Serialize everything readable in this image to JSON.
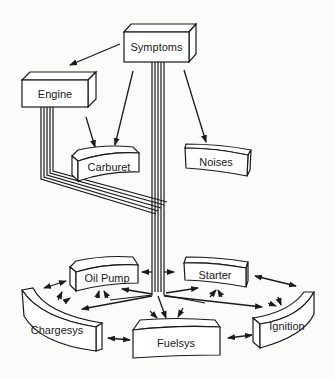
{
  "diagram": {
    "nodes": {
      "symptoms": "Symptoms",
      "engine": "Engine",
      "carburet": "Carburet",
      "noises": "Noises",
      "oil_pump": "Oil Pump",
      "starter": "Starter",
      "chargesys": "Chargesys",
      "fuelsys": "Fuelsys",
      "ignition": "Ignition"
    },
    "edges": [
      {
        "from": "Symptoms",
        "to": "Engine",
        "type": "arrow"
      },
      {
        "from": "Symptoms",
        "to": "Carburet",
        "type": "arrow"
      },
      {
        "from": "Symptoms",
        "to": "Noises",
        "type": "arrow"
      },
      {
        "from": "Engine",
        "to": "Carburet",
        "type": "arrow"
      },
      {
        "from": "Symptoms",
        "to": "bus",
        "type": "bus-4-lines"
      },
      {
        "from": "Engine",
        "to": "bus",
        "type": "bus-4-lines"
      },
      {
        "from": "bus",
        "to": "Oil Pump",
        "type": "arrow"
      },
      {
        "from": "bus",
        "to": "Starter",
        "type": "arrow"
      },
      {
        "from": "bus",
        "to": "Chargesys",
        "type": "arrow"
      },
      {
        "from": "bus",
        "to": "Fuelsys",
        "type": "arrow"
      },
      {
        "from": "bus",
        "to": "Ignition",
        "type": "arrow"
      },
      {
        "from": "Oil Pump",
        "to": "Chargesys",
        "type": "bidirectional"
      },
      {
        "from": "Starter",
        "to": "Ignition",
        "type": "bidirectional"
      },
      {
        "from": "Chargesys",
        "to": "Fuelsys",
        "type": "bidirectional"
      },
      {
        "from": "Fuelsys",
        "to": "Ignition",
        "type": "bidirectional"
      }
    ],
    "colors": {
      "stroke": "#1a1a1a",
      "fill": "#ffffff",
      "background": "#fbfbf9"
    }
  }
}
